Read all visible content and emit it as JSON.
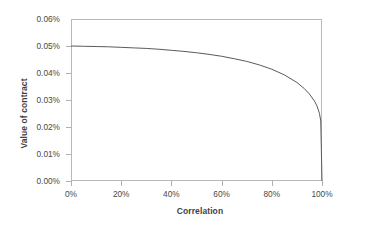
{
  "chart_data": {
    "type": "line",
    "title": "",
    "xlabel": "Correlation",
    "ylabel": "Value of contract",
    "xlim": [
      0,
      100
    ],
    "ylim": [
      0,
      0.06
    ],
    "grid": false,
    "legend": false,
    "x_tick_labels": [
      "0%",
      "20%",
      "40%",
      "60%",
      "80%",
      "100%"
    ],
    "x_ticks": [
      0,
      20,
      40,
      60,
      80,
      100
    ],
    "y_tick_labels": [
      "0.00%",
      "0.01%",
      "0.02%",
      "0.03%",
      "0.04%",
      "0.05%",
      "0.06%"
    ],
    "y_ticks": [
      0,
      0.01,
      0.02,
      0.03,
      0.04,
      0.05,
      0.06
    ],
    "series": [
      {
        "name": "Value of contract",
        "color": "#5a5a5a",
        "x": [
          0,
          5,
          10,
          15,
          20,
          25,
          30,
          35,
          40,
          45,
          50,
          55,
          60,
          65,
          70,
          75,
          80,
          85,
          90,
          93,
          95,
          97,
          98,
          99,
          99.5,
          100
        ],
        "values": [
          0.05,
          0.0499,
          0.0498,
          0.0497,
          0.0495,
          0.0493,
          0.0491,
          0.0488,
          0.0484,
          0.048,
          0.0475,
          0.0469,
          0.0462,
          0.0453,
          0.0443,
          0.043,
          0.0414,
          0.0393,
          0.0365,
          0.0342,
          0.0322,
          0.0296,
          0.0278,
          0.025,
          0.0222,
          0.0
        ]
      }
    ]
  }
}
